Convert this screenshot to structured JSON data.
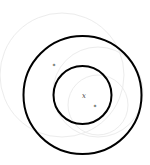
{
  "diagram": {
    "type": "concentric-circles",
    "background_color": "#ffffff",
    "stroke_color": "#000000",
    "faint_color": "#ececec",
    "center": {
      "x": 82.5,
      "y": 95
    },
    "outer_circle": {
      "r": 59
    },
    "inner_circle": {
      "r": 29
    },
    "center_label": "x",
    "markers": [
      {
        "name": "star-marker-1",
        "x": 54,
        "y": 66
      },
      {
        "name": "star-marker-2",
        "x": 95,
        "y": 107
      }
    ]
  }
}
